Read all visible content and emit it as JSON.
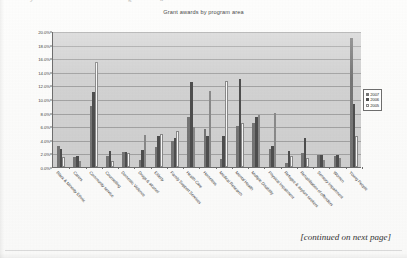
{
  "page": {
    "top_fragment_1": "y",
    "top_fragment_2": "g",
    "top_fragment_3": "a",
    "footer_note": "[continued on next page]"
  },
  "legend": {
    "position": "right",
    "entries": [
      {
        "label": "2007",
        "color": "#767676"
      },
      {
        "label": "2006",
        "color": "#4e4e4e"
      },
      {
        "label": "2005",
        "color": "#fafafa"
      }
    ]
  },
  "chart_data": {
    "type": "bar",
    "title": "Grant awards by program area",
    "xlabel": "",
    "ylabel": "",
    "ylim": [
      0,
      20
    ],
    "ytick_labels": [
      "0.0%",
      "2.0%",
      "4.0%",
      "6.0%",
      "8.0%",
      "10.0%",
      "12.0%",
      "14.0%",
      "16.0%",
      "18.0%",
      "20.0%"
    ],
    "ytick_values": [
      0,
      2,
      4,
      6,
      8,
      10,
      12,
      14,
      16,
      18,
      20
    ],
    "grid": true,
    "categories": [
      "Black & Minority Ethnic",
      "Carers",
      "Community service",
      "Counselling",
      "Domestic Violence",
      "Drugs & alcohol",
      "Elderly",
      "Family Support Services",
      "Health Care",
      "Homeless",
      "Medical Research",
      "Mental Health",
      "Multiple Disability",
      "Physical Impairment",
      "Refugee & asylum seekers",
      "Rehabilitation of offenders",
      "Sensory Impairment",
      "Women",
      "Young People"
    ],
    "series": [
      {
        "name": "2007",
        "color": "#767676",
        "values": [
          3.1,
          1.4,
          9.0,
          1.6,
          2.2,
          1.1,
          2.9,
          3.8,
          7.4,
          5.6,
          1.2,
          6.1,
          6.5,
          2.7,
          0.6,
          2.0,
          1.7,
          1.6,
          18.9
        ]
      },
      {
        "name": "2006",
        "color": "#4e4e4e",
        "values": [
          2.6,
          1.6,
          11.0,
          2.4,
          2.2,
          2.5,
          4.6,
          4.3,
          12.5,
          4.6,
          4.5,
          13.0,
          7.3,
          3.1,
          2.3,
          4.3,
          1.7,
          1.8,
          9.3
        ]
      },
      {
        "name": "2005",
        "color": "#fafafa",
        "values": [
          1.4,
          0.9,
          15.4,
          0.9,
          2.1,
          4.7,
          4.8,
          5.3,
          5.9,
          11.2,
          12.7,
          6.5,
          7.7,
          8.0,
          1.6,
          1.3,
          1.1,
          1.3,
          4.6
        ]
      }
    ]
  }
}
